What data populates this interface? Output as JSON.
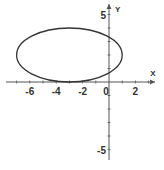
{
  "chart_data": {
    "type": "line",
    "title": "",
    "xlabel": "X",
    "ylabel": "Y",
    "xlim": [
      -7.5,
      3.5
    ],
    "ylim": [
      -5.5,
      5.5
    ],
    "grid": false,
    "x_ticks": [
      -6,
      -4,
      -2,
      0,
      2
    ],
    "x_tick_labels": [
      "-6",
      "-4",
      "-2",
      "0",
      "2"
    ],
    "y_ticks": [
      5,
      -5
    ],
    "y_tick_labels": [
      "5",
      "-5"
    ],
    "series": [
      {
        "name": "ellipse",
        "shape": "ellipse",
        "center": [
          -3,
          2
        ],
        "semi_axis_x": 4,
        "semi_axis_y": 2,
        "equation": "(x+3)^2/16 + (y-2)^2/4 = 1",
        "color": "#333333"
      }
    ]
  },
  "style": {
    "axis_color": "#555555",
    "curve_color": "#333333"
  }
}
